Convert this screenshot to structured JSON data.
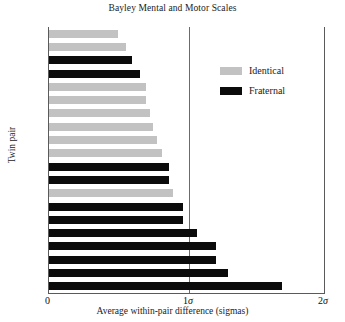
{
  "chart_data": {
    "type": "bar",
    "orientation": "horizontal",
    "title": "Bayley Mental and Motor Scales",
    "xlabel": "Average within-pair difference (sigmas)",
    "ylabel": "Twin pair",
    "xlim": [
      0,
      2
    ],
    "xticks": [
      {
        "value": 0,
        "label": "0"
      },
      {
        "value": 1,
        "label": "1σ"
      },
      {
        "value": 2,
        "label": "2σ"
      }
    ],
    "grid": false,
    "gridlines_x": [
      1
    ],
    "legend_position": "top-right",
    "legend": [
      {
        "name": "Identical",
        "color": "#c2c2c2"
      },
      {
        "name": "Fraternal",
        "color": "#0b0b0b"
      }
    ],
    "categories": [
      "B",
      "D",
      "H",
      "N",
      "F",
      "E",
      "A",
      "G",
      "K",
      "I",
      "Q",
      "P",
      "C",
      "R",
      "O",
      "L",
      "M",
      "J",
      "T",
      "S"
    ],
    "values": [
      0.5,
      0.56,
      0.6,
      0.66,
      0.7,
      0.7,
      0.73,
      0.75,
      0.78,
      0.82,
      0.87,
      0.87,
      0.9,
      0.97,
      0.97,
      1.07,
      1.21,
      1.21,
      1.3,
      1.69
    ],
    "groups": [
      "Identical",
      "Identical",
      "Fraternal",
      "Fraternal",
      "Identical",
      "Identical",
      "Identical",
      "Identical",
      "Identical",
      "Identical",
      "Fraternal",
      "Fraternal",
      "Identical",
      "Fraternal",
      "Fraternal",
      "Fraternal",
      "Fraternal",
      "Fraternal",
      "Fraternal",
      "Fraternal"
    ],
    "bars": [
      {
        "category": "B",
        "value": 0.5,
        "group": "Identical"
      },
      {
        "category": "D",
        "value": 0.56,
        "group": "Identical"
      },
      {
        "category": "H",
        "value": 0.6,
        "group": "Fraternal"
      },
      {
        "category": "N",
        "value": 0.66,
        "group": "Fraternal"
      },
      {
        "category": "F",
        "value": 0.7,
        "group": "Identical"
      },
      {
        "category": "E",
        "value": 0.7,
        "group": "Identical"
      },
      {
        "category": "A",
        "value": 0.73,
        "group": "Identical"
      },
      {
        "category": "G",
        "value": 0.75,
        "group": "Identical"
      },
      {
        "category": "K",
        "value": 0.78,
        "group": "Identical"
      },
      {
        "category": "I",
        "value": 0.82,
        "group": "Identical"
      },
      {
        "category": "Q",
        "value": 0.87,
        "group": "Fraternal"
      },
      {
        "category": "P",
        "value": 0.87,
        "group": "Fraternal"
      },
      {
        "category": "C",
        "value": 0.9,
        "group": "Identical"
      },
      {
        "category": "R",
        "value": 0.97,
        "group": "Fraternal"
      },
      {
        "category": "O",
        "value": 0.97,
        "group": "Fraternal"
      },
      {
        "category": "L",
        "value": 1.07,
        "group": "Fraternal"
      },
      {
        "category": "M",
        "value": 1.21,
        "group": "Fraternal"
      },
      {
        "category": "J",
        "value": 1.21,
        "group": "Fraternal"
      },
      {
        "category": "T",
        "value": 1.3,
        "group": "Fraternal"
      },
      {
        "category": "S",
        "value": 1.69,
        "group": "Fraternal"
      }
    ]
  },
  "colors": {
    "identical": "#c2c2c2",
    "fraternal": "#0b0b0b",
    "axis": "#5a5a5a",
    "gridline": "#6b6b6b",
    "text": "#1a1a1a",
    "background": "#ffffff"
  }
}
